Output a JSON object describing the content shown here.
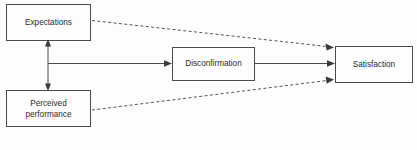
{
  "diagram": {
    "type": "path-diagram",
    "background_color": "#fdfdfd",
    "line_color": "#4c4c4c",
    "text_color": "#2b2b2b",
    "nodes": [
      {
        "id": "expectations",
        "label": "Expectations",
        "lines": [
          "Expectations"
        ],
        "x": 6,
        "y": 4,
        "width": 84,
        "height": 36
      },
      {
        "id": "perceived-performance",
        "label": "Perceived performance",
        "lines": [
          "Perceived",
          "performance"
        ],
        "x": 6,
        "y": 90,
        "width": 84,
        "height": 36
      },
      {
        "id": "disconfirmation",
        "label": "Disconfirmation",
        "lines": [
          "Disconfirmation"
        ],
        "x": 172,
        "y": 47,
        "width": 82,
        "height": 33
      },
      {
        "id": "satisfaction",
        "label": "Satisfaction",
        "lines": [
          "Satisfaction"
        ],
        "x": 335,
        "y": 46,
        "width": 77,
        "height": 36
      }
    ],
    "edges": [
      {
        "id": "expectations-perceived-double",
        "style": "solid",
        "from": "perceived-performance",
        "to": "expectations",
        "arrows": "both",
        "description": "double-headed vertical arrow between Expectations and Perceived performance"
      },
      {
        "id": "comparison-to-disconfirmation",
        "style": "solid",
        "from": "comparison-junction",
        "to": "disconfirmation",
        "arrows": "end",
        "description": "horizontal arrow into Disconfirmation"
      },
      {
        "id": "disconfirmation-to-satisfaction",
        "style": "solid",
        "from": "disconfirmation",
        "to": "satisfaction",
        "arrows": "end",
        "description": "horizontal arrow into Satisfaction"
      },
      {
        "id": "expectations-to-satisfaction",
        "style": "dashed",
        "from": "expectations",
        "to": "satisfaction",
        "arrows": "end",
        "description": "dashed direct effect of Expectations on Satisfaction"
      },
      {
        "id": "perceived-performance-to-satisfaction",
        "style": "dashed",
        "from": "perceived-performance",
        "to": "satisfaction",
        "arrows": "end",
        "description": "dashed direct effect of Perceived performance on Satisfaction"
      }
    ]
  }
}
